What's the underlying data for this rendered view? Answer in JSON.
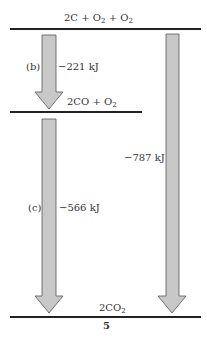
{
  "levels": {
    "top": {
      "coef": "2C",
      "plus1": "+",
      "o2a": "O",
      "sub_a": "2",
      "plus2": "+",
      "o2b": "O",
      "sub_b": "2"
    },
    "middle": {
      "coef": "2CO",
      "plus": "+",
      "o2": "O",
      "sub": "2"
    },
    "bottom": {
      "coef": "2CO",
      "sub": "2"
    }
  },
  "arrows": {
    "b": {
      "label": "(b)",
      "value": "−221 kJ"
    },
    "c": {
      "label": "(c)",
      "value": "−566 kJ"
    },
    "total": {
      "value": "−787 kJ"
    }
  },
  "figure_number": "5",
  "colors": {
    "arrow_fill": "#c8c8c8",
    "arrow_stroke": "#555555",
    "line": "#222222"
  }
}
